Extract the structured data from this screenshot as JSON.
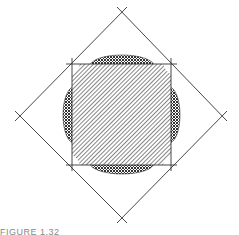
{
  "figure": {
    "colors": {
      "line": "#333333",
      "hatch": "#444444",
      "background": "#ffffff"
    },
    "inner_square": {
      "x1": 72,
      "y1": 64,
      "x2": 171,
      "y2": 165
    },
    "diamond": {
      "top": [
        122,
        12
      ],
      "right": [
        222,
        116
      ],
      "bottom": [
        122,
        218
      ],
      "left": [
        20,
        116
      ]
    }
  },
  "caption": {
    "text": "FIGURE 1.32"
  }
}
